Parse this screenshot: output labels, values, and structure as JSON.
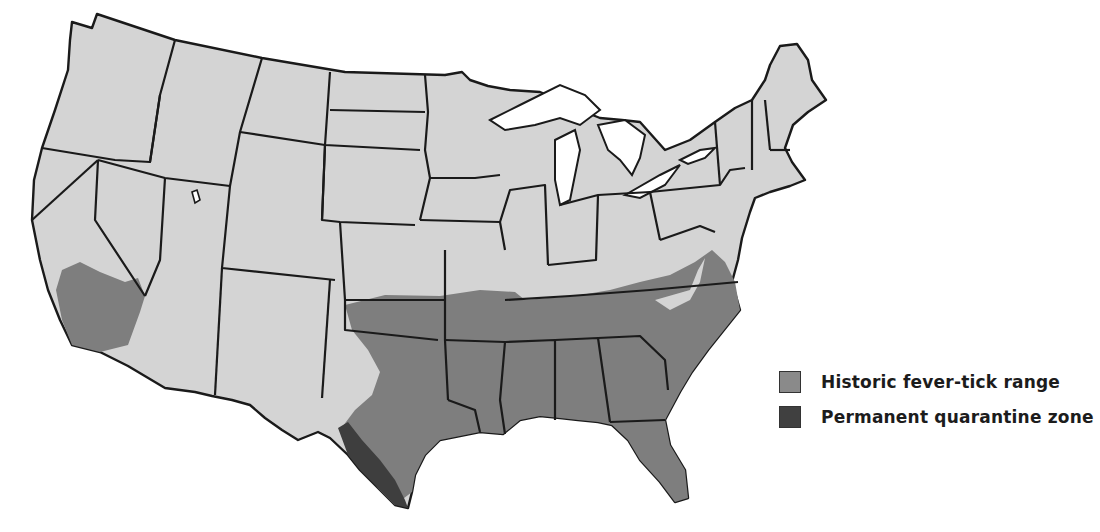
{
  "map": {
    "subject": "Contiguous United States",
    "colors": {
      "background": "#ffffff",
      "base_land": "#d4d4d4",
      "historic_range": "#7e7e7e",
      "quarantine_zone": "#3e3e3e",
      "borders": "#1a1a1a",
      "water": "#ffffff"
    }
  },
  "legend": {
    "items": [
      {
        "label": "Historic fever-tick range",
        "color": "#8a8a8a"
      },
      {
        "label": "Permanent quarantine zone",
        "color": "#404040"
      }
    ]
  }
}
